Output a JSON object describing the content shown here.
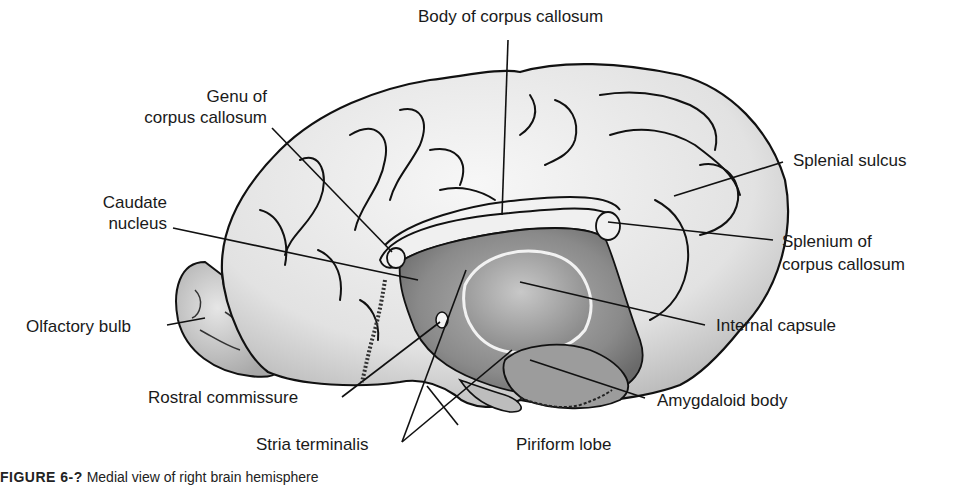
{
  "figure": {
    "caption_prefix": "FIGURE 6-?",
    "caption_text": "Medial view of right brain hemisphere",
    "labels": {
      "body_cc": "Body of corpus callosum",
      "genu_1": "Genu of",
      "genu_2": "corpus callosum",
      "caudate_1": "Caudate",
      "caudate_2": "nucleus",
      "olfactory": "Olfactory bulb",
      "rostral": "Rostral commissure",
      "stria": "Stria terminalis",
      "piriform": "Piriform lobe",
      "amygdaloid": "Amygdaloid body",
      "internal": "Internal capsule",
      "splenium_1": "Splenium of",
      "splenium_2": "corpus callosum",
      "splenial": "Splenial sulcus"
    },
    "colors": {
      "cortex": "#ececec",
      "cortex_shade": "#c9c9c9",
      "deep": "#8f8f8f",
      "outline": "#111111",
      "leader": "#111111"
    }
  }
}
